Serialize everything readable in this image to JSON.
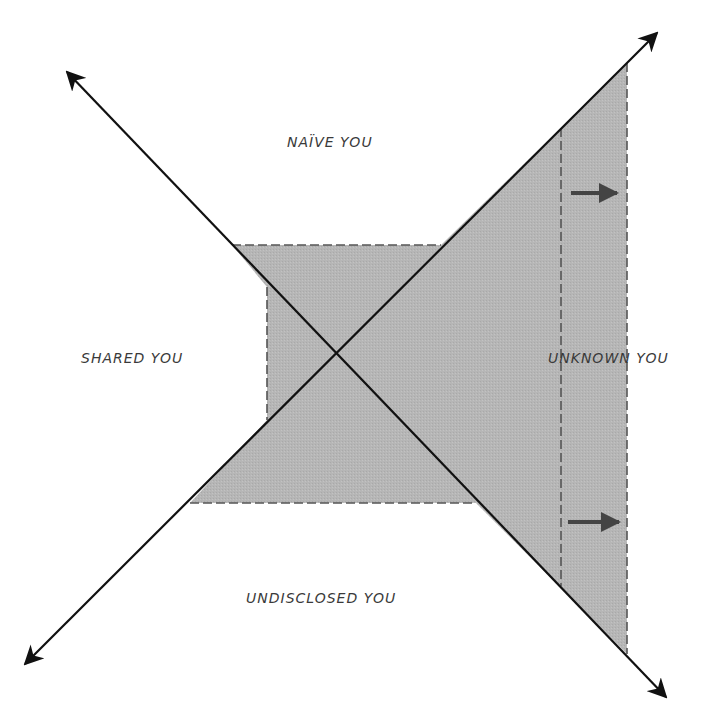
{
  "diagram": {
    "type": "johari-style expanding-self diagram",
    "colors": {
      "background": "#ffffff",
      "shaded_region": "#b4b4b4",
      "axis_line": "#111111",
      "dashed_border": "#555555",
      "expansion_arrow": "#444444",
      "label_text": "#3a3a3a"
    },
    "labels": {
      "top": "NAÏVE YOU",
      "left": "SHARED YOU",
      "right": "UNKNOWN YOU",
      "bottom": "UNDISCLOSED YOU"
    },
    "axes": [
      {
        "name": "diagonal-top-left-to-bottom-right",
        "arrow_ends": [
          "top-left",
          "bottom-right"
        ]
      },
      {
        "name": "diagonal-bottom-left-to-top-right",
        "arrow_ends": [
          "bottom-left",
          "top-right"
        ]
      }
    ],
    "expansion_arrows": [
      {
        "name": "upper-expansion-arrow",
        "direction": "right"
      },
      {
        "name": "lower-expansion-arrow",
        "direction": "right"
      }
    ]
  }
}
